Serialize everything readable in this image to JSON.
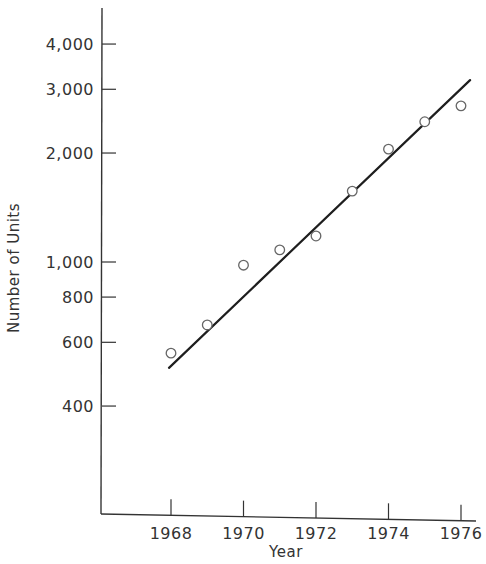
{
  "chart_data": {
    "type": "scatter",
    "title": "",
    "xlabel": "Year",
    "ylabel": "Number of Units",
    "yscale": "log",
    "xlim": [
      1965.4,
      1976.5
    ],
    "ylim": [
      200,
      5500
    ],
    "grid": false,
    "legend": null,
    "x_ticks": [
      1968,
      1970,
      1972,
      1974,
      1976
    ],
    "x_tick_labels": [
      "1968",
      "1970",
      "1972",
      "1974",
      "1976"
    ],
    "y_ticks": [
      400,
      600,
      800,
      1000,
      2000,
      3000,
      4000
    ],
    "y_tick_labels": [
      "400",
      "600",
      "800",
      "1,000",
      "2,000",
      "3,000",
      "4,000"
    ],
    "series": [
      {
        "name": "Observed",
        "marker": "open-circle",
        "x": [
          1968,
          1969,
          1970,
          1971,
          1972,
          1973,
          1974,
          1975,
          1976
        ],
        "values": [
          560,
          670,
          980,
          1080,
          1180,
          1570,
          2050,
          2440,
          2700
        ]
      },
      {
        "name": "Trend line",
        "style": "line",
        "x": [
          1968,
          1976.25
        ],
        "values": [
          510,
          3180
        ],
        "gaps_at_points": [
          1969,
          1973,
          1974
        ]
      }
    ]
  },
  "colors": {
    "axis": "#333333",
    "line": "#1e1e1e",
    "marker_stroke": "#666666",
    "text": "#333333",
    "background": "#ffffff"
  }
}
